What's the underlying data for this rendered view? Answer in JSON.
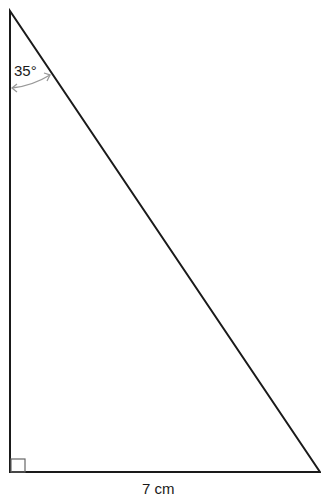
{
  "diagram": {
    "type": "right-triangle",
    "angle_label": "35°",
    "base_label": "7 cm",
    "right_angle_marker": true,
    "colors": {
      "stroke": "#1a1a1a",
      "arc": "#999999",
      "marker": "#666666"
    }
  }
}
